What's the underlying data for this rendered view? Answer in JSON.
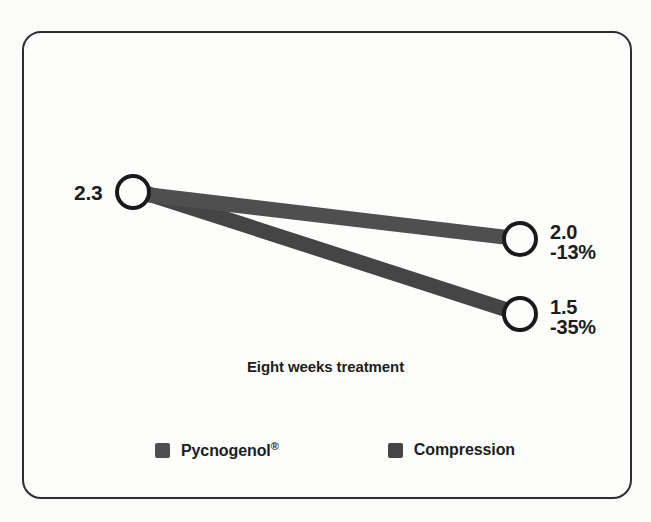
{
  "figure": {
    "frame_border_color": "#2e2e2e",
    "background_color": "#fdfdfc",
    "axis_caption": "Eight weeks treatment"
  },
  "labels": {
    "baseline": "2.3",
    "pycnogenol_value": "2.0",
    "pycnogenol_delta": "-13%",
    "compression_value": "1.5",
    "compression_delta": "-35%"
  },
  "legend": {
    "items": [
      {
        "label": "Pycnogenol",
        "superscript": "®",
        "color": "#4f4f4f",
        "swatch_icon": "square-swatch-icon"
      },
      {
        "label": "Compression",
        "superscript": "",
        "color": "#454545",
        "swatch_icon": "square-swatch-icon"
      }
    ]
  },
  "chart_data": {
    "type": "line",
    "title": "",
    "subtitle": "",
    "xlabel": "Eight weeks treatment",
    "ylabel": "",
    "x": [
      "Baseline",
      "Eight weeks treatment"
    ],
    "categories": [
      "Baseline",
      "Eight weeks treatment"
    ],
    "series": [
      {
        "name": "Pycnogenol",
        "values": [
          2.3,
          2.0
        ],
        "change_percent": -13,
        "change_label": "-13%",
        "color": "#4f4f4f",
        "endpoint_labels": [
          "2.3",
          "2.0"
        ]
      },
      {
        "name": "Compression",
        "values": [
          2.3,
          1.5
        ],
        "change_percent": -35,
        "change_label": "-35%",
        "color": "#454545",
        "endpoint_labels": [
          "2.3",
          "1.5"
        ]
      }
    ],
    "shared_start_value": 2.3,
    "ylim": [
      1.3,
      2.5
    ],
    "grid": false,
    "legend_position": "bottom",
    "marker": "open-circle",
    "annotations": [
      {
        "text": "2.3",
        "position": "left-of-start-marker"
      },
      {
        "text": "2.0",
        "position": "right-of-pycnogenol-end-marker"
      },
      {
        "text": "-13%",
        "position": "right-of-pycnogenol-end-marker"
      },
      {
        "text": "1.5",
        "position": "right-of-compression-end-marker"
      },
      {
        "text": "-35%",
        "position": "right-of-compression-end-marker"
      },
      {
        "text": "Eight weeks treatment",
        "position": "below-center"
      }
    ]
  },
  "geometry": {
    "start_marker": {
      "cx": 133,
      "cy": 192,
      "r": 16
    },
    "pycnogenol_end_marker": {
      "cx": 520,
      "cy": 239,
      "r": 16
    },
    "compression_end_marker": {
      "cx": 520,
      "cy": 314,
      "r": 16
    },
    "band_thickness": 15
  }
}
